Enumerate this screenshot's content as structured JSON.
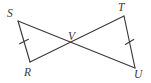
{
  "figure": {
    "type": "geometry-diagram",
    "background_color": "#ffffff",
    "stroke_color": "#3a3a3c",
    "label_color": "#3a3a3c",
    "width": 151,
    "height": 83,
    "vertices": [
      {
        "id": "S",
        "label": "S",
        "x": 18,
        "y": 21,
        "label_x": 7,
        "label_y": 8
      },
      {
        "id": "R",
        "label": "R",
        "x": 30,
        "y": 62,
        "label_x": 24,
        "label_y": 67
      },
      {
        "id": "T",
        "label": "T",
        "x": 124,
        "y": 16,
        "label_x": 118,
        "label_y": 2
      },
      {
        "id": "U",
        "label": "U",
        "x": 135,
        "y": 68,
        "label_x": 134,
        "label_y": 69
      },
      {
        "id": "V",
        "label": "V",
        "x": 73,
        "y": 44,
        "label_x": 68,
        "label_y": 31
      }
    ],
    "segments": [
      {
        "id": "SR",
        "from": "S",
        "to": "R",
        "x1": 18,
        "y1": 21,
        "x2": 30,
        "y2": 62,
        "ticks": 1
      },
      {
        "id": "TU",
        "from": "T",
        "to": "U",
        "x1": 124,
        "y1": 16,
        "x2": 135,
        "y2": 68,
        "ticks": 1
      },
      {
        "id": "SU",
        "from": "S",
        "to": "U",
        "x1": 18,
        "y1": 21,
        "x2": 135,
        "y2": 68,
        "ticks": 0
      },
      {
        "id": "RT",
        "from": "R",
        "to": "T",
        "x1": 30,
        "y1": 62,
        "x2": 124,
        "y2": 16,
        "ticks": 0
      }
    ],
    "tick_marks": [
      {
        "id": "tick-SR",
        "on_segment": "SR",
        "x": 24,
        "y": 41.5
      },
      {
        "id": "tick-TU",
        "on_segment": "TU",
        "x": 129.5,
        "y": 42
      }
    ]
  }
}
